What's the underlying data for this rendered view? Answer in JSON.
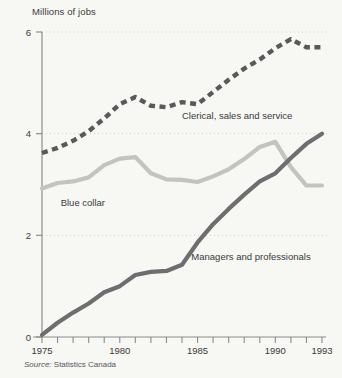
{
  "chart_data": {
    "type": "line",
    "title": "",
    "ylabel": "Millions of jobs",
    "xlabel": "",
    "ylim": [
      0,
      6
    ],
    "xlim": [
      1975,
      1993
    ],
    "yticks": [
      0,
      2,
      4,
      6
    ],
    "ytick_labels": [
      "0",
      "2",
      "4",
      "6"
    ],
    "xticks": [
      1975,
      1976,
      1977,
      1978,
      1979,
      1980,
      1981,
      1982,
      1983,
      1984,
      1985,
      1986,
      1987,
      1988,
      1989,
      1990,
      1991,
      1992,
      1993
    ],
    "xtick_labels_shown": [
      "1975",
      "1980",
      "1985",
      "1990",
      "1993"
    ],
    "grid": "horizontal-dotted",
    "legend_position": "inline-annotations",
    "x": [
      1975,
      1976,
      1977,
      1978,
      1979,
      1980,
      1981,
      1982,
      1983,
      1984,
      1985,
      1986,
      1987,
      1988,
      1989,
      1990,
      1991,
      1992,
      1993
    ],
    "series": [
      {
        "name": "Clerical, sales and service",
        "style": "dashed",
        "color": "#59595b",
        "label": "Clerical, sales and service",
        "values": [
          3.62,
          3.72,
          3.86,
          4.05,
          4.3,
          4.58,
          4.72,
          4.55,
          4.52,
          4.62,
          4.58,
          4.82,
          5.06,
          5.28,
          5.46,
          5.68,
          5.86,
          5.7,
          5.7
        ]
      },
      {
        "name": "Blue collar",
        "style": "solid",
        "color": "#c3c3c0",
        "label": "Blue collar",
        "values": [
          2.92,
          3.03,
          3.06,
          3.14,
          3.38,
          3.51,
          3.54,
          3.22,
          3.1,
          3.09,
          3.05,
          3.16,
          3.3,
          3.5,
          3.74,
          3.84,
          3.34,
          2.98,
          2.98
        ]
      },
      {
        "name": "Managers and professionals",
        "style": "solid",
        "color": "#6e6e70",
        "label": "Managers and professionals",
        "values": [
          0.04,
          0.28,
          0.48,
          0.66,
          0.88,
          1.0,
          1.22,
          1.28,
          1.3,
          1.42,
          1.86,
          2.22,
          2.52,
          2.8,
          3.06,
          3.22,
          3.52,
          3.8,
          4.0
        ]
      }
    ],
    "annotations": [
      {
        "text": "Clerical, sales and service",
        "x": 1984.0,
        "y": 4.28
      },
      {
        "text": "Blue collar",
        "x": 1976.2,
        "y": 2.58
      },
      {
        "text": "Managers and professionals",
        "x": 1984.6,
        "y": 1.52
      }
    ]
  },
  "source": {
    "prefix": "Source:",
    "text": " Statistics Canada"
  },
  "colors": {
    "background": "#f7f7f4",
    "axis": "#8c8c8c",
    "grid": "#cfcfc9",
    "text": "#3a3a3a",
    "clerical": "#59595b",
    "blue_collar": "#c3c3c0",
    "managers": "#6e6e70"
  }
}
